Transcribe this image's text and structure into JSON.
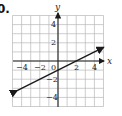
{
  "problem_label": "0.",
  "chart_data": {
    "type": "line",
    "title": "",
    "xlabel": "x",
    "ylabel": "y",
    "xlim": [
      -5,
      5
    ],
    "ylim": [
      -5,
      5
    ],
    "grid": true,
    "x_ticks": [
      -4,
      -2,
      0,
      2,
      4
    ],
    "y_ticks": [
      4,
      2,
      -2,
      -4
    ],
    "series": [
      {
        "name": "line",
        "equation": "y = 0.5x - 1",
        "points": [
          [
            -4.5,
            -3.25
          ],
          [
            0,
            -1
          ],
          [
            2,
            0
          ],
          [
            5,
            1.5
          ]
        ],
        "arrows": "both"
      }
    ]
  },
  "ticks": {
    "xm4": "−4",
    "xm2": "−2",
    "x0": "0",
    "x2": "2",
    "x4": "4",
    "y4": "4",
    "y2": "2",
    "ym2": "−2",
    "ym4": "−4"
  },
  "axes": {
    "x": "x",
    "y": "y"
  },
  "colors": {
    "grid": "#b8b8b8",
    "axis": "#222222",
    "line": "#1a1a1a"
  }
}
